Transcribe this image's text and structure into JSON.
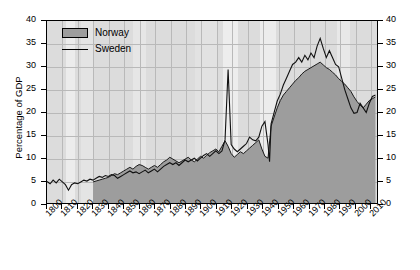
{
  "chart_data": {
    "type": "area",
    "title": "",
    "xlabel": "",
    "ylabel": "Percentage of GDP",
    "xlim": [
      1800,
      2015
    ],
    "ylim": [
      0,
      40
    ],
    "grid": true,
    "legend_position": "top-left",
    "y_ticks": [
      0,
      5,
      10,
      15,
      20,
      25,
      30,
      35,
      40
    ],
    "y_ticks_right": [
      0,
      5,
      10,
      15,
      20,
      25,
      30,
      35,
      40
    ],
    "x_ticks": [
      1800,
      1810,
      1820,
      1830,
      1840,
      1850,
      1860,
      1870,
      1880,
      1890,
      1900,
      1910,
      1920,
      1930,
      1940,
      1950,
      1960,
      1970,
      1980,
      1990,
      2000,
      2010
    ],
    "series": [
      {
        "name": "Norway",
        "render": "area",
        "fill_color": "#9d9d9d",
        "line_color": "#1a1a1a",
        "x": [
          1830,
          1832,
          1834,
          1836,
          1838,
          1840,
          1842,
          1844,
          1846,
          1848,
          1850,
          1852,
          1854,
          1856,
          1858,
          1860,
          1862,
          1864,
          1866,
          1868,
          1870,
          1872,
          1874,
          1876,
          1878,
          1880,
          1882,
          1884,
          1886,
          1888,
          1890,
          1892,
          1894,
          1896,
          1898,
          1900,
          1902,
          1904,
          1906,
          1908,
          1910,
          1912,
          1914,
          1916,
          1918,
          1920,
          1922,
          1924,
          1926,
          1928,
          1930,
          1932,
          1934,
          1936,
          1938,
          1940,
          1942,
          1944,
          1946,
          1948,
          1950,
          1952,
          1954,
          1956,
          1958,
          1960,
          1962,
          1964,
          1966,
          1968,
          1970,
          1972,
          1974,
          1976,
          1978,
          1980,
          1982,
          1984,
          1986,
          1988,
          1990,
          1992,
          1994,
          1996,
          1998,
          2000,
          2002,
          2004,
          2006,
          2008,
          2010,
          2012,
          2014
        ],
        "values": [
          4.8,
          5.0,
          5.2,
          5.4,
          5.6,
          5.8,
          6.2,
          6.6,
          6.4,
          6.8,
          7.2,
          7.6,
          8.0,
          7.6,
          8.2,
          8.6,
          8.4,
          8.0,
          7.6,
          8.0,
          8.4,
          8.0,
          8.6,
          9.2,
          9.6,
          10.2,
          9.8,
          9.4,
          9.0,
          9.4,
          9.8,
          10.2,
          9.6,
          9.2,
          9.8,
          10.4,
          10.0,
          10.6,
          11.2,
          11.6,
          12.0,
          11.4,
          12.6,
          13.8,
          12.6,
          11.0,
          10.2,
          10.8,
          11.4,
          11.0,
          11.6,
          12.2,
          12.8,
          13.4,
          14.0,
          12.0,
          10.4,
          10.0,
          17.0,
          19.0,
          21.0,
          22.6,
          23.8,
          24.6,
          25.4,
          26.2,
          27.0,
          27.6,
          28.4,
          29.0,
          29.4,
          29.8,
          30.2,
          30.6,
          31.0,
          30.4,
          29.8,
          29.4,
          28.8,
          28.2,
          27.4,
          26.8,
          26.2,
          25.4,
          24.6,
          23.4,
          22.4,
          21.6,
          21.0,
          21.8,
          22.6,
          23.0,
          23.4
        ]
      },
      {
        "name": "Sweden",
        "render": "line",
        "line_color": "#111111",
        "x": [
          1800,
          1802,
          1804,
          1806,
          1808,
          1810,
          1812,
          1814,
          1816,
          1818,
          1820,
          1822,
          1824,
          1826,
          1828,
          1830,
          1832,
          1834,
          1836,
          1838,
          1840,
          1842,
          1844,
          1846,
          1848,
          1850,
          1852,
          1854,
          1856,
          1858,
          1860,
          1862,
          1864,
          1866,
          1868,
          1870,
          1872,
          1874,
          1876,
          1878,
          1880,
          1882,
          1884,
          1886,
          1888,
          1890,
          1892,
          1894,
          1896,
          1898,
          1900,
          1902,
          1904,
          1906,
          1908,
          1910,
          1912,
          1914,
          1916,
          1918,
          1920,
          1922,
          1924,
          1926,
          1928,
          1930,
          1932,
          1934,
          1936,
          1938,
          1940,
          1942,
          1944,
          1945,
          1946,
          1948,
          1950,
          1952,
          1954,
          1956,
          1958,
          1960,
          1962,
          1964,
          1966,
          1968,
          1970,
          1972,
          1974,
          1976,
          1978,
          1980,
          1982,
          1984,
          1986,
          1988,
          1990,
          1992,
          1994,
          1996,
          1998,
          2000,
          2002,
          2004,
          2006,
          2008,
          2010,
          2012,
          2014
        ],
        "values": [
          4.9,
          4.4,
          5.2,
          4.6,
          5.4,
          4.8,
          4.2,
          3.0,
          4.2,
          4.6,
          4.4,
          4.8,
          5.2,
          5.0,
          5.4,
          5.2,
          5.6,
          6.0,
          5.8,
          6.2,
          6.0,
          6.4,
          6.2,
          5.6,
          6.0,
          6.4,
          6.8,
          7.2,
          6.8,
          7.0,
          6.6,
          7.0,
          7.4,
          6.8,
          7.2,
          7.6,
          7.0,
          7.6,
          8.2,
          8.6,
          9.0,
          8.6,
          9.0,
          8.4,
          9.0,
          9.6,
          9.2,
          9.6,
          10.0,
          9.4,
          10.0,
          10.6,
          11.0,
          10.4,
          11.0,
          11.6,
          11.0,
          11.6,
          14.0,
          29.4,
          13.0,
          12.0,
          11.4,
          12.0,
          12.6,
          13.2,
          14.6,
          14.0,
          13.8,
          14.6,
          17.0,
          18.0,
          13.0,
          9.2,
          17.5,
          20.0,
          22.5,
          24.0,
          26.0,
          27.5,
          29.0,
          30.5,
          31.0,
          32.0,
          31.0,
          32.5,
          31.5,
          33.0,
          32.0,
          34.5,
          36.2,
          34.0,
          32.0,
          33.5,
          32.0,
          30.5,
          30.0,
          27.5,
          25.0,
          23.0,
          21.0,
          19.8,
          20.0,
          22.0,
          21.0,
          20.0,
          22.0,
          23.5,
          23.8
        ]
      }
    ],
    "background_bands": [
      {
        "start": 1800,
        "end": 1812,
        "color": "#dcdcdc"
      },
      {
        "start": 1812,
        "end": 1818,
        "color": "#ececec"
      },
      {
        "start": 1818,
        "end": 1822,
        "color": "#dcdcdc"
      },
      {
        "start": 1822,
        "end": 1830,
        "color": "#e4e4e4"
      },
      {
        "start": 1830,
        "end": 1856,
        "color": "#dcdcdc"
      },
      {
        "start": 1856,
        "end": 1864,
        "color": "#e6e6e6"
      },
      {
        "start": 1864,
        "end": 1896,
        "color": "#dcdcdc"
      },
      {
        "start": 1896,
        "end": 1910,
        "color": "#e2e2e2"
      },
      {
        "start": 1910,
        "end": 1914,
        "color": "#dcdcdc"
      },
      {
        "start": 1914,
        "end": 1924,
        "color": "#ededed"
      },
      {
        "start": 1924,
        "end": 1938,
        "color": "#dcdcdc"
      },
      {
        "start": 1938,
        "end": 1948,
        "color": "#ececec"
      },
      {
        "start": 1948,
        "end": 1988,
        "color": "#dcdcdc"
      },
      {
        "start": 1988,
        "end": 1996,
        "color": "#e8e8e8"
      },
      {
        "start": 1996,
        "end": 2015,
        "color": "#dcdcdc"
      }
    ]
  },
  "legend": {
    "entries": [
      {
        "label": "Norway",
        "marker": "area-swatch"
      },
      {
        "label": "Sweden",
        "marker": "line-swatch"
      }
    ]
  },
  "axes": {
    "y_left_label": "Percentage of GDP"
  }
}
